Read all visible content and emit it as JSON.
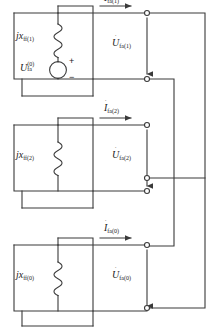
{
  "figure": {
    "type": "circuit-diagram"
  },
  "networks": [
    {
      "id": "positive-sequence",
      "impedance": {
        "prefix": "j",
        "symbol": "x",
        "subscript": "ff(1)"
      },
      "source": {
        "symbol": "U",
        "subscript": "fa",
        "superscript": "(0)",
        "plus": "+",
        "minus": "−"
      },
      "voltage": {
        "symbol": "U",
        "subscript": "fa(1)",
        "dot": "˙"
      },
      "current": {
        "symbol": "I",
        "subscript": "fa(1)",
        "dot": "˙"
      }
    },
    {
      "id": "negative-sequence",
      "impedance": {
        "prefix": "j",
        "symbol": "x",
        "subscript": "ff(2)"
      },
      "voltage": {
        "symbol": "U",
        "subscript": "fa(2)",
        "dot": "˙"
      },
      "current": {
        "symbol": "I",
        "subscript": "fa(2)",
        "dot": "˙"
      }
    },
    {
      "id": "zero-sequence",
      "impedance": {
        "prefix": "j",
        "symbol": "x",
        "subscript": "ff(0)"
      },
      "voltage": {
        "symbol": "U",
        "subscript": "fa(0)",
        "dot": "˙"
      },
      "current": {
        "symbol": "I",
        "subscript": "fa(0)",
        "dot": "˙"
      }
    }
  ],
  "colors": {
    "line": "#3a3a3a",
    "text": "#1a1a1a",
    "node_fill": "#ffffff"
  }
}
